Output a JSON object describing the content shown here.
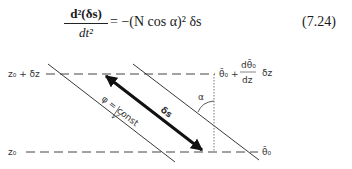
{
  "equation": {
    "numerator": "d²(δs)",
    "denominator": "dt²",
    "rhs": "= −(N cos α)² δs",
    "number": "(7.24)"
  },
  "diagram": {
    "labels": {
      "top_level": "z₀ + δz",
      "bottom_level": "z₀",
      "top_theta": "θ̄₀ + (dθ̄₀/dz) δz",
      "top_theta_base": "θ̄₀ +",
      "top_theta_frac_num": "dθ̄₀",
      "top_theta_frac_den": "dz",
      "top_theta_suffix": "δz",
      "bottom_theta": "θ̄₀",
      "isentrope": "φ = const",
      "displacement": "δs",
      "angle": "α"
    },
    "colors": {
      "line": "#222222",
      "arrow": "#111111",
      "text": "#333333"
    }
  }
}
